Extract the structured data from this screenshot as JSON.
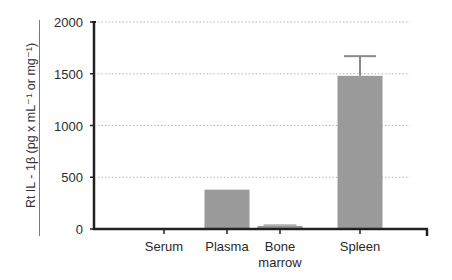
{
  "chart_data": {
    "type": "bar",
    "title": "",
    "xlabel": "",
    "ylabel": "Rt IL - 1β   (pg x mL⁻¹ or mg⁻¹)",
    "categories": [
      "Serum",
      "Plasma",
      "Bone marrow",
      "Spleen"
    ],
    "category_lines": [
      [
        "Serum"
      ],
      [
        "Plasma"
      ],
      [
        "Bone",
        "marrow"
      ],
      [
        "Spleen"
      ]
    ],
    "values": [
      0,
      380,
      30,
      1480
    ],
    "error_upper": [
      0,
      0,
      45,
      1670
    ],
    "ylim": [
      0,
      2000
    ],
    "yticks": [
      0,
      500,
      1000,
      1500,
      2000
    ],
    "grid": "horizontal dotted",
    "legend": "none",
    "bar_color": "#9a9a9a"
  }
}
